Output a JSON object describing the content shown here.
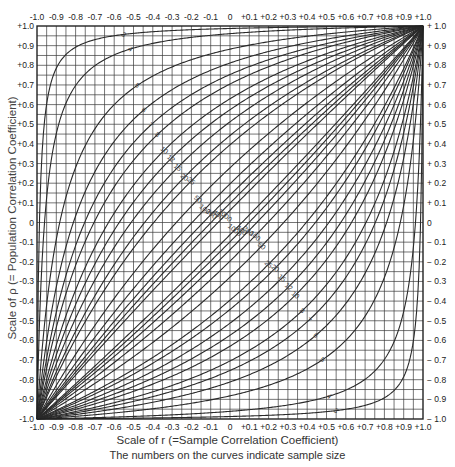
{
  "chart_data": {
    "type": "line",
    "title": "",
    "xlabel": "Scale of r (=Sample Correlation Coefficient)",
    "ylabel": "Scale of ρ (= Population Correlation Coefficient)",
    "caption": "The numbers on the curves indicate sample size",
    "xlim": [
      -1.0,
      1.0
    ],
    "ylim": [
      -1.0,
      1.0
    ],
    "grid": true,
    "grid_step": 0.05,
    "x_ticks_top": [
      "-1.0",
      "-0.9",
      "-0.8",
      "-0.7",
      "-0.6",
      "-0.5",
      "-0.4",
      "-0.3",
      "-0.2",
      "-0.1",
      "0",
      "+0.1",
      "+0.2",
      "+0.3",
      "+0.4",
      "+0.5",
      "+0.6",
      "+0.7",
      "+0.8",
      "+0.9",
      "+1.0"
    ],
    "x_ticks_bottom": [
      "-1.0",
      "-0.9",
      "-0.8",
      "-0.7",
      "-0.6",
      "-0.5",
      "-0.4",
      "-0.3",
      "-0.2",
      "-0.1",
      "0",
      "+0.1",
      "+0.2",
      "+0.3",
      "+0.4",
      "+0.5",
      "+0.6",
      "+0.7",
      "+0.8",
      "+0.9",
      "+1.0"
    ],
    "y_ticks_left": [
      "+1.0",
      "+0.9",
      "+0.8",
      "+0.7",
      "+0.6",
      "+0.5",
      "+0.4",
      "+0.3",
      "+0.2",
      "+0.1",
      "0",
      "-0.1",
      "-0.2",
      "-0.3",
      "-0.4",
      "-0.5",
      "-0.6",
      "-0.7",
      "-0.8",
      "-0.9",
      "-1.0"
    ],
    "y_ticks_right": [
      "+ 1.0",
      "+ 0.9",
      "+ 0.8",
      "+ 0.7",
      "+ 0.6",
      "+ 0.5",
      "+ 0.4",
      "+ 0.3",
      "+ 0.2",
      "+ 0.1",
      "0",
      "− 0.1",
      "− 0.2",
      "− 0.3",
      "− 0.4",
      "− 0.5",
      "− 0.6",
      "− 0.7",
      "− 0.8",
      "− 0.9",
      "− 1.0"
    ],
    "series_type": "confidence belts (upper and lower) for rho given r, by sample size",
    "sample_sizes": [
      3,
      4,
      5,
      6,
      7,
      8,
      10,
      12,
      15,
      20,
      25,
      50,
      100,
      200,
      400,
      1000
    ],
    "curve_labels": [
      "3",
      "4",
      "5",
      "6",
      "7",
      "8",
      "10",
      "12",
      "15",
      "20",
      "25",
      "50",
      "100",
      "200",
      "400",
      "1000"
    ],
    "confidence_level": 0.95,
    "z_critical": 1.96
  },
  "colors": {
    "line": "#2a2a2a",
    "grid": "#3a3a3a",
    "background": "#ffffff"
  }
}
